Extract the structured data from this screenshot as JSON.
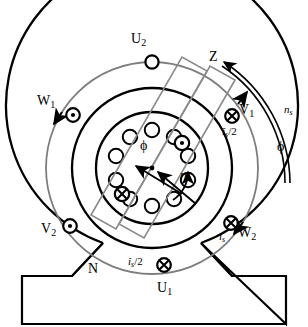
{
  "figure": {
    "type": "electrical-machine-cross-section"
  },
  "colors": {
    "outline": "#000000",
    "winding_ring": "#777777",
    "coil_box": "#888888",
    "background": "#ffffff"
  },
  "labels": {
    "u2": {
      "text": "U",
      "sub": "2"
    },
    "u1": {
      "text": "U",
      "sub": "1"
    },
    "v1": {
      "text": "V",
      "sub": "1"
    },
    "v2": {
      "text": "V",
      "sub": "2"
    },
    "w1": {
      "text": "W",
      "sub": "1"
    },
    "w2": {
      "text": "W",
      "sub": "2"
    },
    "z": {
      "text": "Z"
    },
    "n_coil": {
      "text": "N"
    },
    "ns": {
      "text": "n",
      "sub": "s"
    },
    "phi_outer": {
      "text": "ϕ"
    },
    "phi_rotor": {
      "text": "ϕ"
    },
    "n_rotor": {
      "text": "n"
    },
    "is_half_right": {
      "text": "î",
      "sub": "s",
      "div": "/2"
    },
    "is_half_bottom": {
      "text": "î",
      "sub": "s",
      "div": "/2"
    },
    "is_full": {
      "text": "î",
      "sub": "s"
    }
  },
  "geometry": {
    "center": {
      "x": 152,
      "y": 168
    },
    "radii": {
      "housing_outer": 146,
      "winding_ring": 106,
      "stator_bore": 80,
      "rotor": 56,
      "rotor_bar_circle": 38
    },
    "rotor_bar_count": 10,
    "coil_axis_angle_deg": -60
  },
  "markers": {
    "current_out_of_page": "dot-in-circle",
    "current_into_page": "cross-in-circle",
    "slots": [
      {
        "name": "u2-slot",
        "symbol": "empty-circle",
        "angle_deg": 90
      },
      {
        "name": "w1-slot",
        "symbol": "dot-in-circle",
        "angle_deg": 150
      },
      {
        "name": "v2-slot",
        "symbol": "dot-in-circle",
        "angle_deg": 210
      },
      {
        "name": "u1-slot",
        "symbol": "cross-in-circle",
        "angle_deg": 270
      },
      {
        "name": "w2-slot",
        "symbol": "cross-in-circle",
        "angle_deg": 330
      },
      {
        "name": "v1-slot",
        "symbol": "cross-in-circle",
        "angle_deg": 30
      }
    ],
    "rotor_slots": [
      {
        "name": "rotor-conductor-dot",
        "symbol": "dot-in-circle",
        "angle_deg": 36
      },
      {
        "name": "rotor-conductor-cross",
        "symbol": "cross-in-circle",
        "angle_deg": 216
      }
    ]
  },
  "arrows": {
    "ns_direction": "clockwise",
    "rotor_direction": "counter-clockwise-indicator",
    "flux_arrows": 2
  }
}
